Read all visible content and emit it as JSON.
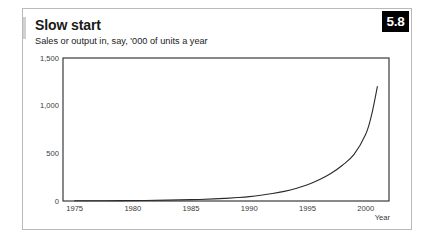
{
  "figure": {
    "number_badge": "5.8",
    "title": "Slow start",
    "subtitle": "Sales or output in, say, '000 of units a year"
  },
  "chart_data": {
    "type": "line",
    "title": "Slow start",
    "subtitle": "Sales or output in, say, '000 of units a year",
    "xlabel": "Year",
    "ylabel": "",
    "xlim": [
      1974,
      2002
    ],
    "ylim": [
      0,
      1500
    ],
    "grid": false,
    "legend": null,
    "x_ticks": [
      "1975",
      "1980",
      "1985",
      "1990",
      "1995",
      "2000"
    ],
    "x_tick_values": [
      1975,
      1980,
      1985,
      1990,
      1995,
      2000
    ],
    "y_ticks": [
      "0",
      "500",
      "1,000",
      "1,500"
    ],
    "y_tick_values": [
      0,
      500,
      1000,
      1500
    ],
    "series": [
      {
        "name": "Sales or output",
        "color": "#2b2b2b",
        "x": [
          1975,
          1977,
          1979,
          1981,
          1983,
          1985,
          1987,
          1988,
          1989,
          1990,
          1991,
          1992,
          1993,
          1994,
          1995,
          1996,
          1997,
          1998,
          1999,
          2000,
          2000.5,
          2001
        ],
        "values": [
          2,
          3,
          4,
          6,
          9,
          14,
          22,
          28,
          36,
          46,
          60,
          78,
          101,
          131,
          170,
          222,
          288,
          375,
          489,
          700,
          900,
          1200
        ]
      }
    ]
  }
}
